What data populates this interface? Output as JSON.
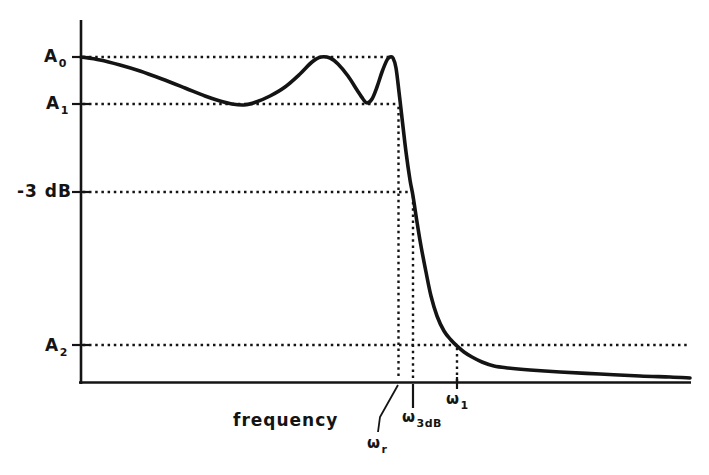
{
  "figure": {
    "background": "#ffffff",
    "ink_color": "#141414"
  },
  "chart_data": {
    "type": "line",
    "xlabel": "frequency",
    "ylabel": "",
    "grid": false,
    "legend": "none",
    "axes_numeric": false,
    "y_axis_labels": [
      {
        "base": "A",
        "sub": "0",
        "level_px": 57
      },
      {
        "base": "A",
        "sub": "1",
        "level_px": 104
      },
      {
        "base": "-3 dB",
        "sub": "",
        "level_px": 192
      },
      {
        "base": "A",
        "sub": "2",
        "level_px": 345
      }
    ],
    "x_axis_labels": [
      {
        "base": "ω",
        "sub": "r",
        "x_px": 398
      },
      {
        "base": "ω",
        "sub": "3dB",
        "x_px": 413
      },
      {
        "base": "ω",
        "sub": "1",
        "x_px": 457
      }
    ],
    "axes_px": {
      "y_axis": [
        81,
        20,
        81,
        384
      ],
      "x_axis": [
        79,
        382.5,
        691,
        382.5
      ]
    },
    "y_tick_levels_px": [
      57,
      104,
      192,
      345
    ],
    "y_tick_x": [
      72,
      89
    ],
    "guides_h": [
      {
        "name": "A0-level-guide",
        "y": 57,
        "x1": 84,
        "x2": 388
      },
      {
        "name": "A1-level-guide",
        "y": 104,
        "x1": 84,
        "x2": 396
      },
      {
        "name": "minus3dB-level-guide",
        "y": 192,
        "x1": 84,
        "x2": 410
      },
      {
        "name": "A2-level-guide",
        "y": 345,
        "x1": 84,
        "x2": 687
      }
    ],
    "guides_v": [
      {
        "name": "omega-r-guide",
        "x": 398.5,
        "y1": 108,
        "y2": 380
      },
      {
        "name": "omega-3dB-guide",
        "x": 413,
        "y1": 197,
        "y2": 380
      },
      {
        "name": "omega-1-guide",
        "x": 457,
        "y1": 349,
        "y2": 380
      }
    ],
    "below_axis_marks": {
      "omega_3dB_tick": [
        413,
        384,
        413,
        408
      ],
      "omega_1_tick": [
        457,
        377,
        457,
        389
      ],
      "omega_r_leader": [
        [
          398,
          385
        ],
        [
          380,
          417
        ],
        [
          378,
          432
        ]
      ]
    },
    "curve_points_px": [
      [
        81,
        57
      ],
      [
        100,
        60
      ],
      [
        120,
        65
      ],
      [
        140,
        71
      ],
      [
        162,
        79
      ],
      [
        185,
        88
      ],
      [
        205,
        96
      ],
      [
        220,
        101
      ],
      [
        232,
        104
      ],
      [
        244,
        105
      ],
      [
        256,
        102
      ],
      [
        270,
        96
      ],
      [
        285,
        87
      ],
      [
        300,
        74
      ],
      [
        312,
        62
      ],
      [
        321,
        57
      ],
      [
        330,
        58
      ],
      [
        338,
        64
      ],
      [
        348,
        76
      ],
      [
        357,
        90
      ],
      [
        363,
        99
      ],
      [
        367,
        103
      ],
      [
        372,
        99
      ],
      [
        377,
        87
      ],
      [
        382,
        72
      ],
      [
        387,
        60
      ],
      [
        390,
        57
      ],
      [
        393,
        58
      ],
      [
        396,
        68
      ],
      [
        399,
        92
      ],
      [
        402,
        118
      ],
      [
        406,
        152
      ],
      [
        410,
        180
      ],
      [
        413,
        196
      ],
      [
        417,
        222
      ],
      [
        421,
        246
      ],
      [
        426,
        272
      ],
      [
        431,
        296
      ],
      [
        437,
        316
      ],
      [
        444,
        331
      ],
      [
        451,
        340
      ],
      [
        457,
        346
      ],
      [
        464,
        352
      ],
      [
        472,
        357
      ],
      [
        482,
        362
      ],
      [
        494,
        366
      ],
      [
        508,
        368
      ],
      [
        530,
        370
      ],
      [
        560,
        372
      ],
      [
        600,
        374
      ],
      [
        640,
        376
      ],
      [
        670,
        377
      ],
      [
        690,
        378
      ]
    ]
  }
}
